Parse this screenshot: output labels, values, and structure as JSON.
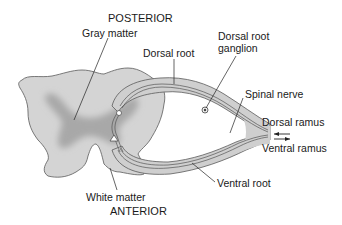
{
  "orientation": {
    "top": "POSTERIOR",
    "bottom": "ANTERIOR"
  },
  "labels": {
    "gray_matter": "Gray matter",
    "white_matter": "White matter",
    "dorsal_root": "Dorsal root",
    "dorsal_root_ganglion_line1": "Dorsal root",
    "dorsal_root_ganglion_line2": "ganglion",
    "spinal_nerve": "Spinal nerve",
    "dorsal_ramus": "Dorsal ramus",
    "ventral_ramus": "Ventral ramus",
    "ventral_root": "Ventral root"
  },
  "colors": {
    "white_matter_fill": "#d4d4d4",
    "gray_matter_fill": "#a9a9a9",
    "outline": "#5a5a5a",
    "nerve_fill": "#cfcfcf",
    "text": "#1a1a1a"
  }
}
